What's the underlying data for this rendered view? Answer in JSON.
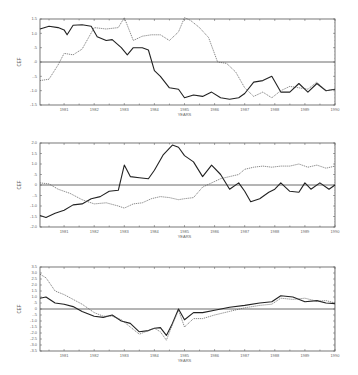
{
  "chart_data": [
    {
      "type": "line",
      "title": "",
      "xlabel": "YEARS",
      "ylabel": "CEF",
      "xlim": [
        1980.2,
        1990
      ],
      "ylim": [
        -1.5,
        1.5
      ],
      "x_ticks": [
        "1981",
        "1982",
        "1983",
        "1984",
        "1985",
        "1986",
        "1987",
        "1988",
        "1989",
        "1990"
      ],
      "y_ticks": [
        "1.5",
        "1.0",
        ".5",
        ".0",
        "-.5",
        "-1.0",
        "-1.5"
      ],
      "grid": false,
      "zero_line": true,
      "series": [
        {
          "name": "solid",
          "style": "solid",
          "x": [
            1980.2,
            1980.5,
            1980.8,
            1981.0,
            1981.1,
            1981.3,
            1981.6,
            1981.9,
            1982.1,
            1982.4,
            1982.6,
            1982.9,
            1983.1,
            1983.3,
            1983.6,
            1983.8,
            1984.0,
            1984.2,
            1984.5,
            1984.8,
            1985.0,
            1985.3,
            1985.6,
            1985.9,
            1986.2,
            1986.5,
            1986.8,
            1987.0,
            1987.3,
            1987.6,
            1987.9,
            1988.2,
            1988.5,
            1988.8,
            1989.1,
            1989.4,
            1989.7,
            1990.0
          ],
          "values": [
            1.15,
            1.25,
            1.2,
            1.12,
            0.95,
            1.28,
            1.3,
            1.25,
            0.88,
            0.75,
            0.78,
            0.5,
            0.25,
            0.5,
            0.5,
            0.42,
            -0.3,
            -0.5,
            -0.9,
            -0.95,
            -1.25,
            -1.15,
            -1.2,
            -1.05,
            -1.25,
            -1.3,
            -1.25,
            -1.1,
            -0.7,
            -0.65,
            -0.5,
            -1.05,
            -1.05,
            -0.75,
            -1.05,
            -0.75,
            -1.0,
            -0.95
          ]
        },
        {
          "name": "dashed",
          "style": "dashed",
          "x": [
            1980.2,
            1980.5,
            1980.8,
            1981.0,
            1981.3,
            1981.6,
            1982.0,
            1982.4,
            1982.8,
            1983.0,
            1983.3,
            1983.6,
            1983.9,
            1984.2,
            1984.5,
            1984.8,
            1985.0,
            1985.2,
            1985.5,
            1985.8,
            1986.1,
            1986.4,
            1986.7,
            1987.0,
            1987.3,
            1987.6,
            1987.9,
            1988.2,
            1988.5,
            1988.8,
            1989.1,
            1989.4,
            1989.7,
            1990.0
          ],
          "values": [
            -0.65,
            -0.6,
            -0.1,
            0.3,
            0.25,
            0.45,
            1.2,
            1.15,
            1.2,
            1.55,
            0.75,
            0.9,
            0.95,
            0.95,
            0.75,
            1.05,
            1.55,
            1.45,
            1.2,
            0.85,
            0.0,
            -0.05,
            -0.35,
            -0.9,
            -1.2,
            -1.05,
            -1.25,
            -1.0,
            -0.85,
            -0.9,
            -0.95,
            -0.7,
            -1.0,
            -0.95
          ]
        }
      ]
    },
    {
      "type": "line",
      "title": "",
      "xlabel": "YEARS",
      "ylabel": "CEF",
      "xlim": [
        1980.2,
        1990
      ],
      "ylim": [
        -2.0,
        2.0
      ],
      "x_ticks": [
        "1981",
        "1982",
        "1983",
        "1984",
        "1985",
        "1986",
        "1987",
        "1988",
        "1989",
        "1990"
      ],
      "y_ticks": [
        "2.0",
        "1.5",
        "1.0",
        ".5",
        "0",
        "-.5",
        "-1.0",
        "-1.5",
        "-2.0"
      ],
      "grid": false,
      "zero_line": true,
      "series": [
        {
          "name": "solid",
          "style": "solid",
          "x": [
            1980.2,
            1980.4,
            1980.7,
            1981.0,
            1981.3,
            1981.6,
            1981.9,
            1982.2,
            1982.5,
            1982.8,
            1983.0,
            1983.2,
            1983.5,
            1983.8,
            1984.0,
            1984.3,
            1984.6,
            1984.8,
            1985.0,
            1985.3,
            1985.6,
            1985.9,
            1986.2,
            1986.5,
            1986.8,
            1987.0,
            1987.2,
            1987.5,
            1987.8,
            1988.0,
            1988.2,
            1988.5,
            1988.8,
            1989.0,
            1989.2,
            1989.5,
            1989.8,
            1990.0
          ],
          "values": [
            -1.45,
            -1.55,
            -1.35,
            -1.2,
            -0.95,
            -0.9,
            -0.65,
            -0.55,
            -0.3,
            -0.25,
            0.95,
            0.4,
            0.35,
            0.3,
            0.7,
            1.45,
            1.9,
            1.8,
            1.4,
            1.1,
            0.4,
            0.95,
            0.5,
            -0.2,
            0.1,
            -0.3,
            -0.8,
            -0.65,
            -0.35,
            -0.2,
            0.1,
            -0.3,
            -0.35,
            0.1,
            -0.2,
            0.1,
            -0.2,
            0.0
          ]
        },
        {
          "name": "dashed",
          "style": "dashed",
          "x": [
            1980.2,
            1980.5,
            1980.8,
            1981.2,
            1981.6,
            1982.0,
            1982.4,
            1982.8,
            1983.0,
            1983.3,
            1983.6,
            1983.9,
            1984.2,
            1984.5,
            1984.8,
            1985.0,
            1985.3,
            1985.6,
            1985.9,
            1986.2,
            1986.5,
            1986.8,
            1987.0,
            1987.3,
            1987.6,
            1987.9,
            1988.2,
            1988.5,
            1988.8,
            1989.1,
            1989.4,
            1989.7,
            1990.0
          ],
          "values": [
            0.1,
            0.05,
            -0.2,
            -0.4,
            -0.7,
            -0.9,
            -0.85,
            -1.0,
            -1.1,
            -0.9,
            -0.85,
            -0.65,
            -0.55,
            -0.6,
            -0.7,
            -0.65,
            -0.6,
            -0.1,
            0.1,
            0.3,
            0.4,
            0.5,
            0.75,
            0.85,
            0.9,
            0.85,
            0.9,
            0.9,
            1.0,
            0.85,
            0.95,
            0.8,
            0.9
          ]
        }
      ]
    },
    {
      "type": "line",
      "title": "",
      "xlabel": "YEARS",
      "ylabel": "CEF",
      "xlim": [
        1980.2,
        1990
      ],
      "ylim": [
        -3.5,
        3.5
      ],
      "x_ticks": [
        "1981",
        "1982",
        "1983",
        "1984",
        "1985",
        "1986",
        "1987",
        "1988",
        "1989",
        "1990"
      ],
      "y_ticks": [
        "3.5",
        "3.0",
        "2.5",
        "2.0",
        "1.5",
        "1.0",
        ".5",
        "0",
        "-.5",
        "-1.0",
        "-1.5",
        "-2.0",
        "-2.5",
        "-3.0",
        "-3.5"
      ],
      "grid": false,
      "zero_line": true,
      "series": [
        {
          "name": "solid",
          "style": "solid",
          "x": [
            1980.2,
            1980.4,
            1980.7,
            1981.0,
            1981.3,
            1981.6,
            1982.0,
            1982.3,
            1982.6,
            1982.9,
            1983.2,
            1983.5,
            1983.8,
            1984.0,
            1984.2,
            1984.4,
            1984.6,
            1984.8,
            1985.0,
            1985.3,
            1985.6,
            1986.0,
            1986.5,
            1987.0,
            1987.5,
            1987.9,
            1988.2,
            1988.6,
            1989.0,
            1989.4,
            1989.7,
            1990.0
          ],
          "values": [
            0.9,
            1.0,
            0.5,
            0.4,
            0.2,
            -0.2,
            -0.6,
            -0.7,
            -0.5,
            -1.0,
            -1.2,
            -1.9,
            -1.8,
            -1.6,
            -1.55,
            -2.2,
            -1.2,
            0.0,
            -0.9,
            -0.3,
            -0.3,
            -0.1,
            0.15,
            0.3,
            0.5,
            0.6,
            1.1,
            1.0,
            0.6,
            0.7,
            0.5,
            0.45
          ]
        },
        {
          "name": "dashed",
          "style": "dashed",
          "x": [
            1980.2,
            1980.4,
            1980.7,
            1981.0,
            1981.3,
            1981.6,
            1982.0,
            1982.3,
            1982.6,
            1982.9,
            1983.2,
            1983.5,
            1983.8,
            1984.0,
            1984.2,
            1984.4,
            1984.6,
            1984.8,
            1985.0,
            1985.3,
            1985.6,
            1986.0,
            1986.5,
            1987.0,
            1987.5,
            1987.9,
            1988.2,
            1988.6,
            1989.0,
            1989.4,
            1989.7,
            1990.0
          ],
          "values": [
            2.9,
            2.6,
            1.5,
            1.2,
            0.8,
            0.4,
            -0.3,
            -0.6,
            -0.6,
            -0.9,
            -1.5,
            -2.1,
            -1.8,
            -1.6,
            -1.9,
            -2.6,
            -1.3,
            -0.1,
            -1.5,
            -0.8,
            -0.8,
            -0.5,
            -0.2,
            0.1,
            0.3,
            0.4,
            0.9,
            0.8,
            0.9,
            0.65,
            0.7,
            0.5
          ]
        }
      ]
    }
  ],
  "axis_title_y": "CEF",
  "axis_title_x": "YEARS"
}
